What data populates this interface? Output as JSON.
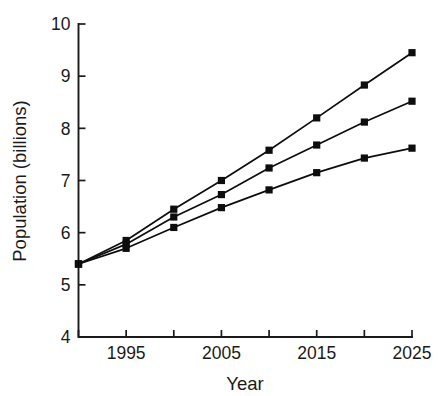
{
  "chart_data": {
    "type": "line",
    "title": "",
    "xlabel": "Year",
    "ylabel": "Population (billions)",
    "xlim": [
      1990,
      2025
    ],
    "ylim": [
      4,
      10
    ],
    "grid": false,
    "legend": "none",
    "x": [
      1990,
      1995,
      2000,
      2005,
      2010,
      2015,
      2020,
      2025
    ],
    "x_ticks": [
      1990,
      1995,
      2000,
      2005,
      2010,
      2015,
      2020,
      2025
    ],
    "x_tick_labels": [
      "",
      "1995",
      "",
      "2005",
      "",
      "2015",
      "",
      "2025"
    ],
    "y_ticks": [
      4,
      5,
      6,
      7,
      8,
      9,
      10
    ],
    "y_tick_labels": [
      "4",
      "5",
      "6",
      "7",
      "8",
      "9",
      "10"
    ],
    "marker": "square",
    "series": [
      {
        "name": "high-projection",
        "values": [
          5.4,
          5.85,
          6.45,
          7.0,
          7.58,
          8.2,
          8.83,
          9.45
        ]
      },
      {
        "name": "medium-projection",
        "values": [
          5.4,
          5.78,
          6.3,
          6.73,
          7.24,
          7.68,
          8.12,
          8.52
        ]
      },
      {
        "name": "low-projection",
        "values": [
          5.4,
          5.7,
          6.1,
          6.48,
          6.82,
          7.15,
          7.43,
          7.62
        ]
      }
    ]
  },
  "axis_titles": {
    "x": "Year",
    "y": "Population (billions)"
  }
}
